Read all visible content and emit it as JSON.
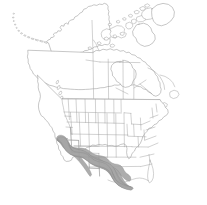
{
  "figure": {
    "title": "North America Distribution Map",
    "type": "species-range-map",
    "region": "North America",
    "background_color": "#ffffff",
    "width": 207,
    "height": 205
  },
  "legend": {
    "range_label": "Shaded range",
    "range_color": "#a6a6a6",
    "boundary_color": "#9a9a9a",
    "coast_color": "#8e8e8e"
  },
  "map": {
    "landmasses": [
      {
        "name": "alaska",
        "label": "Alaska"
      },
      {
        "name": "aleutian-islands",
        "label": "Aleutian Islands"
      },
      {
        "name": "canada-mainland",
        "label": "Canada"
      },
      {
        "name": "canadian-arctic-archipelago",
        "label": "Canadian Arctic Archipelago"
      },
      {
        "name": "greenland-western-edge",
        "label": "Greenland"
      },
      {
        "name": "conterminous-united-states",
        "label": "Conterminous United States"
      },
      {
        "name": "newfoundland",
        "label": "Newfoundland"
      },
      {
        "name": "vancouver-island",
        "label": "Vancouver Island"
      },
      {
        "name": "great-lakes",
        "label": "Great Lakes"
      }
    ],
    "shaded_states": [
      "California",
      "Nevada",
      "Arizona",
      "New Mexico",
      "Texas",
      "southern Utah"
    ],
    "shading_description": "Continuous gray shading across the southwestern United States extending from coastal California southeast through Arizona and New Mexico into Texas and the Gulf coast."
  }
}
